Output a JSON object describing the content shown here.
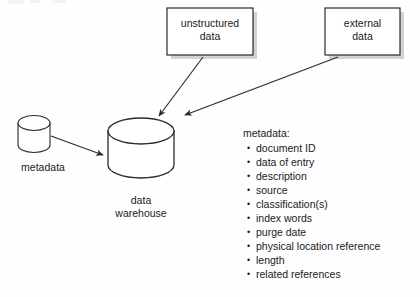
{
  "diagram": {
    "background_color": "#fefefe",
    "stroke_color": "#2b2b2b",
    "shadow_color": "#cfcfcf"
  },
  "sources": {
    "unstructured": {
      "label": "unstructured\ndata",
      "shape": "rectangle"
    },
    "external": {
      "label": "external\ndata",
      "shape": "rectangle"
    }
  },
  "stores": {
    "metadata_store": {
      "label": "metadata",
      "shape": "cylinder"
    },
    "warehouse": {
      "label": "data\nwarehouse",
      "shape": "cylinder"
    }
  },
  "metadata_panel": {
    "heading": "metadata:",
    "attributes": [
      "document ID",
      "data of entry",
      "description",
      "source",
      "classification(s)",
      "index words",
      "purge date",
      "physical location reference",
      "length",
      "related references"
    ]
  },
  "flows": [
    {
      "from": "unstructured data",
      "to": "data warehouse"
    },
    {
      "from": "external data",
      "to": "data warehouse"
    },
    {
      "from": "metadata",
      "to": "data warehouse"
    }
  ]
}
